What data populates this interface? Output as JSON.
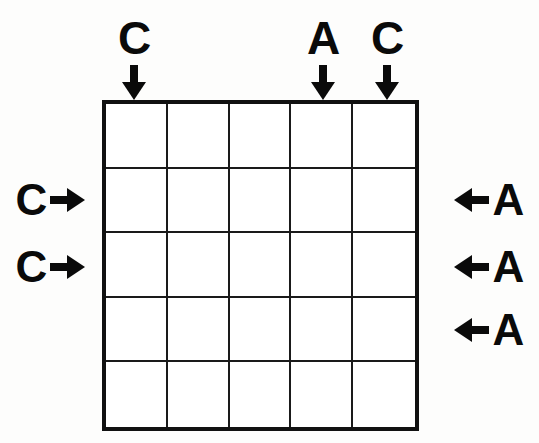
{
  "canvas": {
    "width": 539,
    "height": 443,
    "background": "#fdfdfc",
    "ink": "#0a0a0a"
  },
  "grid": {
    "rows": 5,
    "columns": 5,
    "left": 102,
    "top": 100,
    "width": 317,
    "height": 331,
    "outer_border_color": "#111111",
    "inner_line_color": "#1a1a1a",
    "cell_fill": "#ffffff",
    "cells": [
      [
        "",
        "",
        "",
        "",
        ""
      ],
      [
        "",
        "",
        "",
        "",
        ""
      ],
      [
        "",
        "",
        "",
        "",
        ""
      ],
      [
        "",
        "",
        "",
        "",
        ""
      ],
      [
        "",
        "",
        "",
        "",
        ""
      ]
    ]
  },
  "clues": {
    "top": [
      {
        "label": "C",
        "column": 1,
        "arrow": "arrow-down-icon",
        "x": 134,
        "y": 14
      },
      {
        "label": "A",
        "column": 4,
        "arrow": "arrow-down-icon",
        "x": 323,
        "y": 14
      },
      {
        "label": "C",
        "column": 5,
        "arrow": "arrow-down-icon",
        "x": 387,
        "y": 14
      }
    ],
    "left": [
      {
        "label": "C",
        "row": 2,
        "arrow": "arrow-right-icon",
        "x": 4,
        "y": 175
      },
      {
        "label": "C",
        "row": 3,
        "arrow": "arrow-right-icon",
        "x": 4,
        "y": 242
      }
    ],
    "right": [
      {
        "label": "A",
        "row": 2,
        "arrow": "arrow-left-icon",
        "x": 443,
        "y": 175
      },
      {
        "label": "A",
        "row": 3,
        "arrow": "arrow-left-icon",
        "x": 443,
        "y": 242
      },
      {
        "label": "A",
        "row": 4,
        "arrow": "arrow-left-icon",
        "x": 443,
        "y": 305
      }
    ]
  }
}
